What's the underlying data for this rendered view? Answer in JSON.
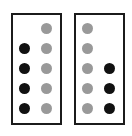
{
  "figure": {
    "width": 132,
    "height": 136,
    "background_color": "#ffffff",
    "dot_diameter": 11,
    "row_centers_y": [
      28,
      48,
      68,
      88,
      108
    ],
    "colors": {
      "black_dot": "#111111",
      "gray_dot": "#999999",
      "panel_border": "#1b1b1b",
      "panel_fill": "#ffffff"
    },
    "panels": [
      {
        "name": "left-panel",
        "x": 11,
        "y": 13,
        "width": 51,
        "height": 112,
        "border_width": 2,
        "columns": [
          {
            "name": "left-column",
            "center_x": 24,
            "dot_color": "black",
            "dot_count": 4,
            "filled_rows": [
              2,
              3,
              4,
              5
            ]
          },
          {
            "name": "right-column",
            "center_x": 46,
            "dot_color": "gray",
            "dot_count": 5,
            "filled_rows": [
              1,
              2,
              3,
              4,
              5
            ]
          }
        ]
      },
      {
        "name": "right-panel",
        "x": 74,
        "y": 13,
        "width": 51,
        "height": 112,
        "border_width": 2,
        "columns": [
          {
            "name": "left-column",
            "center_x": 87,
            "dot_color": "gray",
            "dot_count": 5,
            "filled_rows": [
              1,
              2,
              3,
              4,
              5
            ]
          },
          {
            "name": "right-column",
            "center_x": 109,
            "dot_color": "black",
            "dot_count": 3,
            "filled_rows": [
              3,
              4,
              5
            ]
          }
        ]
      }
    ]
  }
}
